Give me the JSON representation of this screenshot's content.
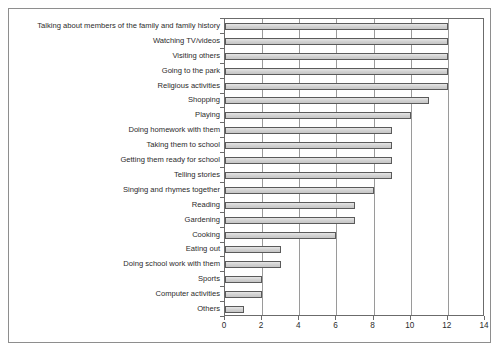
{
  "chart_data": {
    "type": "bar",
    "orientation": "horizontal",
    "title": "",
    "subtitle": "",
    "xlabel": "",
    "ylabel": "",
    "xlim": [
      0,
      14
    ],
    "ylim": [
      0,
      20
    ],
    "xticks": [
      0,
      2,
      4,
      6,
      8,
      10,
      12,
      14
    ],
    "xticklabels": [
      "0",
      "2",
      "4",
      "6",
      "8",
      "10",
      "12",
      "14"
    ],
    "grid": true,
    "grid_axis": "x",
    "legend": false,
    "legend_position": "none",
    "bar_fill_color": "#d4d4d4",
    "bar_edge_color": "#5a5a5a",
    "categories": [
      "Talking about members of the family and family history",
      "Watching TV/videos",
      "Visiting others",
      "Going to the park",
      "Religious activities",
      "Shopping",
      "Playing",
      "Doing homework with them",
      "Taking them to school",
      "Getting them ready for school",
      "Telling stories",
      "Singing and rhymes together",
      "Reading",
      "Gardening",
      "Cooking",
      "Eating out",
      "Doing school work with them",
      "Sports",
      "Computer activities",
      "Others"
    ],
    "values": [
      12,
      12,
      12,
      12,
      12,
      11,
      10,
      9,
      9,
      9,
      9,
      8,
      7,
      7,
      6,
      3,
      3,
      2,
      2,
      1
    ]
  }
}
